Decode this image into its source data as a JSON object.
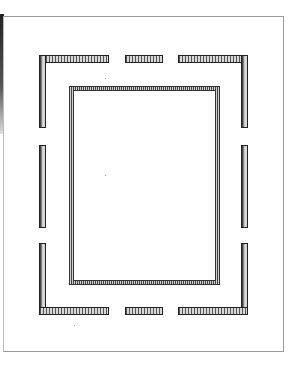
{
  "figure": {
    "type": "frame-mat-drawing",
    "colors": {
      "ink": "#222222",
      "hatch": "#555555",
      "paper": "#ffffff",
      "page_edge": "#9a9a9a"
    },
    "outer_border": {
      "corners": [
        "top-left",
        "top-right",
        "bottom-left",
        "bottom-right"
      ],
      "middle_segments": [
        "top",
        "bottom",
        "left",
        "right"
      ]
    },
    "inner_frame": {
      "style": "double-line hatched"
    }
  }
}
